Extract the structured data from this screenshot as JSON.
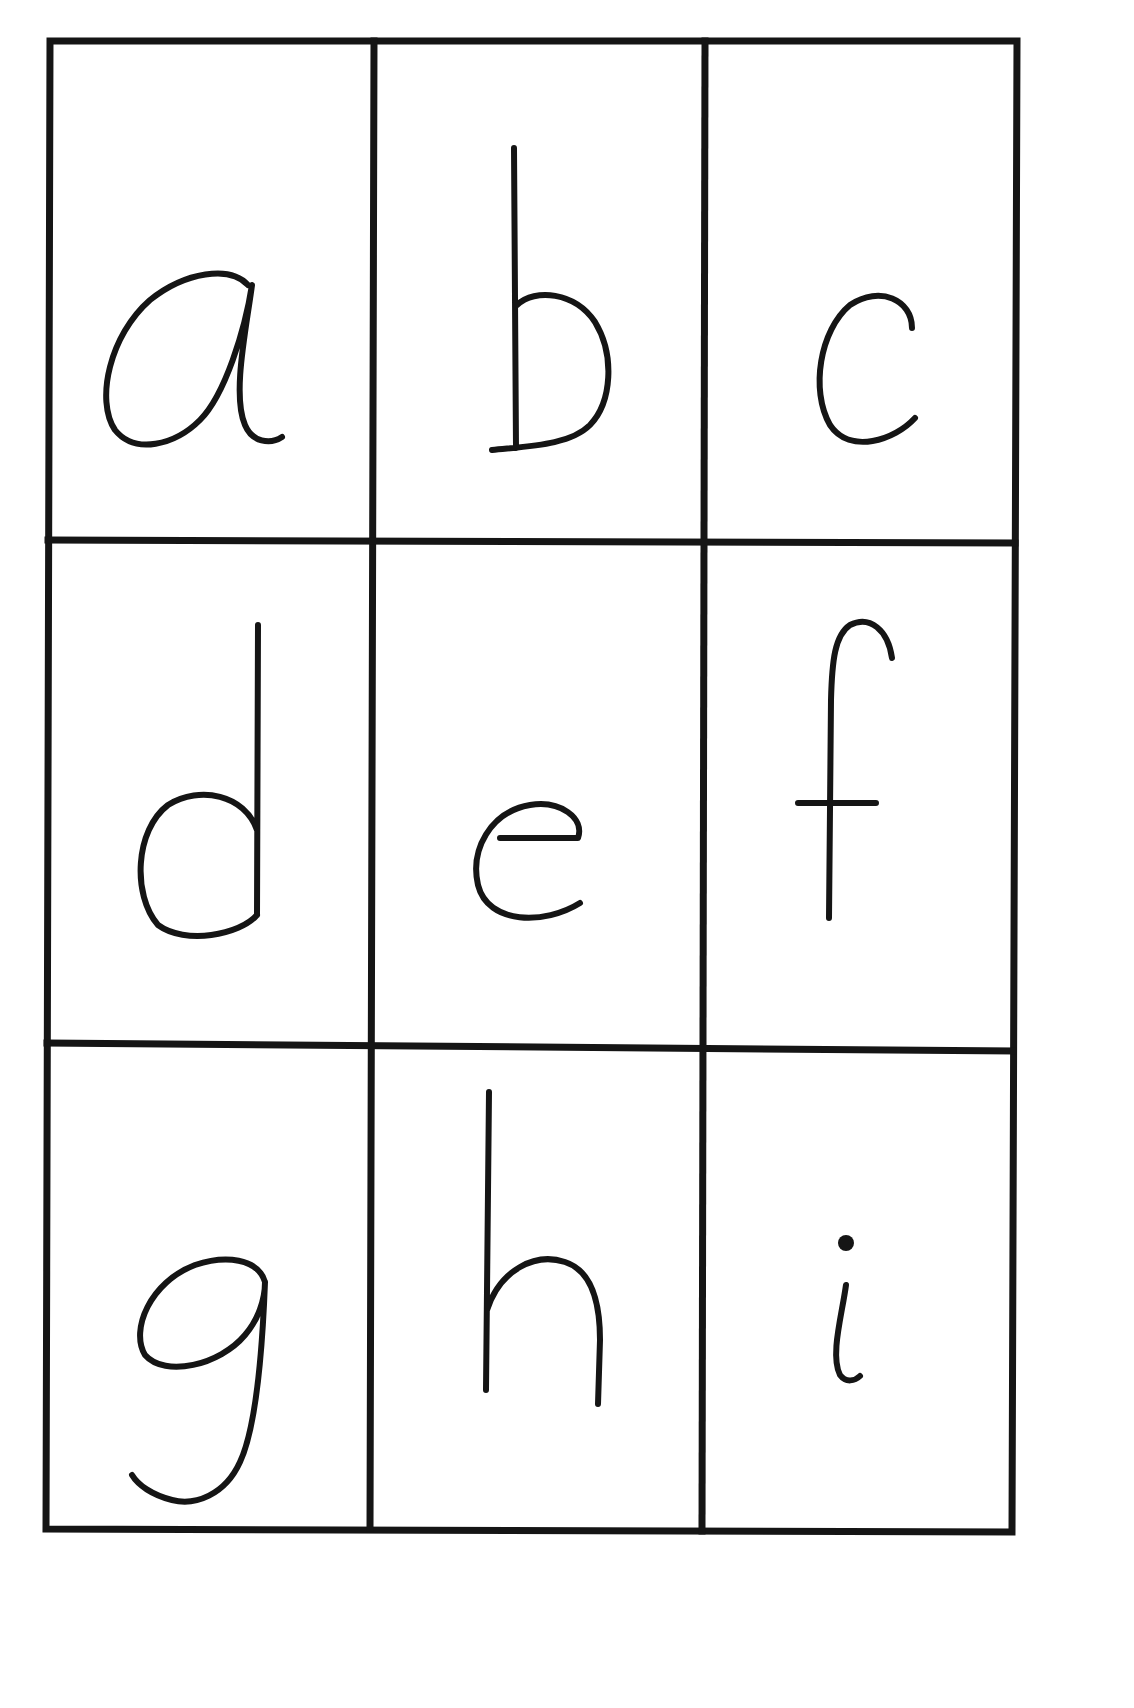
{
  "page": {
    "title": "Lowercase letter cards a–i",
    "background": "#ffffff",
    "ink_color": "#151515"
  },
  "grid": {
    "rows": 3,
    "columns": 3,
    "cells": [
      {
        "letter": "a",
        "row": 1,
        "column": 1
      },
      {
        "letter": "b",
        "row": 1,
        "column": 2
      },
      {
        "letter": "c",
        "row": 1,
        "column": 3
      },
      {
        "letter": "d",
        "row": 2,
        "column": 1
      },
      {
        "letter": "e",
        "row": 2,
        "column": 2
      },
      {
        "letter": "f",
        "row": 2,
        "column": 3
      },
      {
        "letter": "g",
        "row": 3,
        "column": 1
      },
      {
        "letter": "h",
        "row": 3,
        "column": 2
      },
      {
        "letter": "i",
        "row": 3,
        "column": 3
      }
    ]
  }
}
